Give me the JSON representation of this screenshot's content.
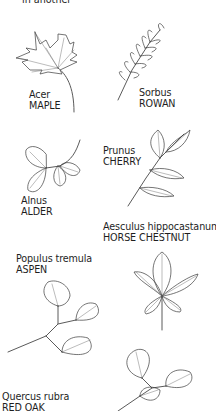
{
  "header": {
    "cut_text": "in another"
  },
  "leaves": [
    {
      "id": "maple",
      "latin": "Acer",
      "common": "MAPLE"
    },
    {
      "id": "rowan",
      "latin": "Sorbus",
      "common": "ROWAN"
    },
    {
      "id": "alder",
      "latin": "Alnus",
      "common": "ALDER"
    },
    {
      "id": "cherry",
      "latin": "Prunus",
      "common": "CHERRY"
    },
    {
      "id": "horse-chestnut",
      "latin": "Aesculus hippocastanum",
      "common": "HORSE CHESTNUT"
    },
    {
      "id": "aspen",
      "latin": "Populus tremula",
      "common": "ASPEN"
    },
    {
      "id": "red-oak",
      "latin": "Quercus rubra",
      "common": "RED OAK"
    }
  ],
  "colors": {
    "background": "#ffffff",
    "text": "#1e1e1e",
    "line": "#3a3a3a"
  }
}
